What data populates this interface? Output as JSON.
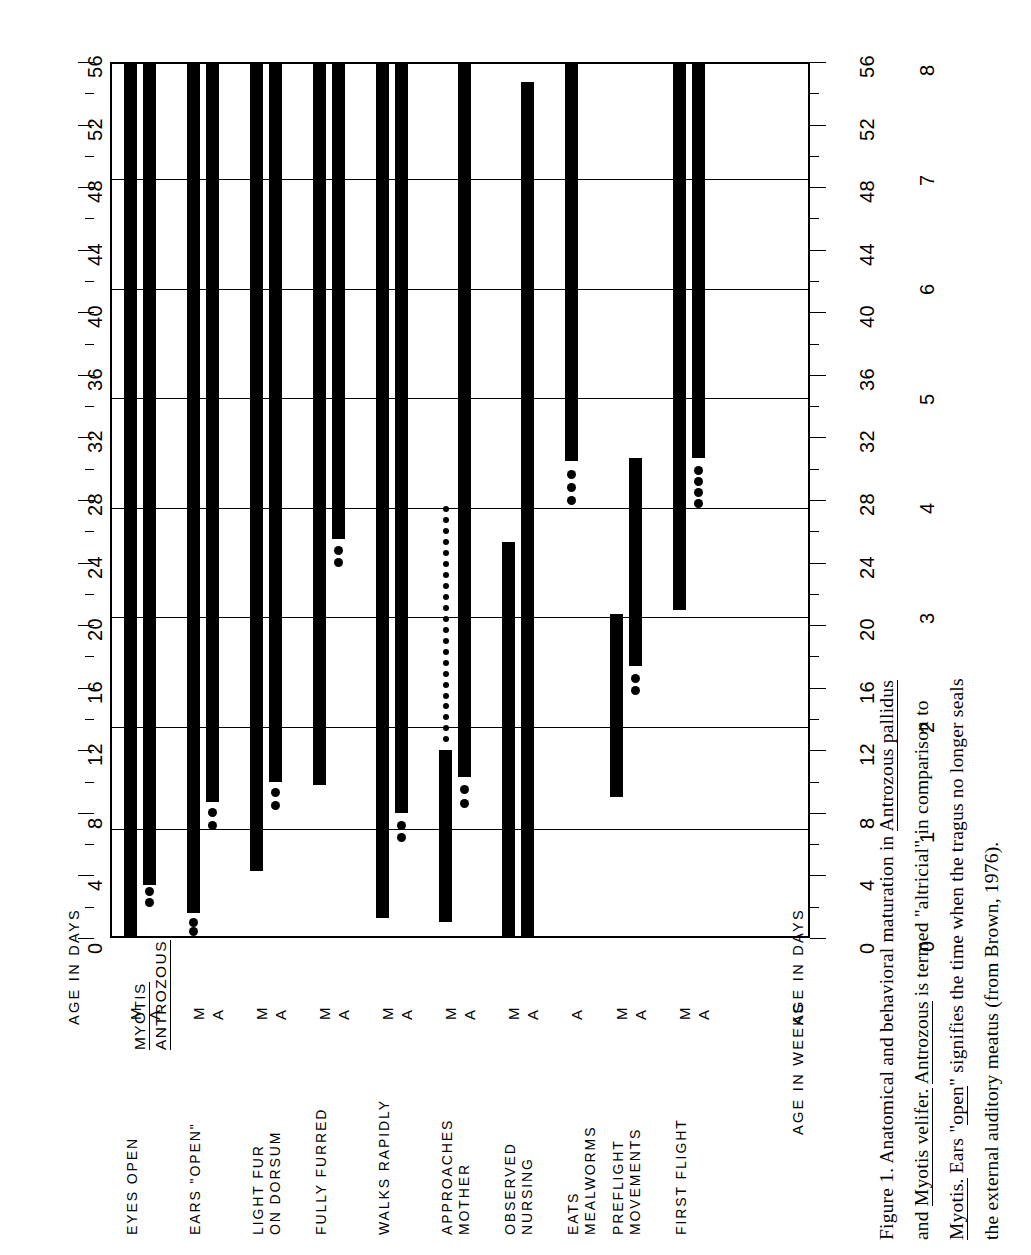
{
  "figure": {
    "caption_lines": [
      "Figure 1.  Anatomical and behavioral maturation in Antrozous pallidus",
      "and Myotis velifer.  Antrozous is termed \"altricial\" in comparison to",
      "Myotis.  Ears \"open\" signifies the time when the tragus no longer seals",
      "the external auditory meatus (from Brown, 1976)."
    ],
    "caption_underlined": [
      [
        "Antrozous pallidus"
      ],
      [
        "Myotis velifer.",
        "Antrozous"
      ],
      [
        "Myotis.",
        "open"
      ],
      []
    ]
  },
  "axes": {
    "days_label": "AGE IN DAYS",
    "weeks_label": "AGE IN WEEKS",
    "days_ticks": [
      0,
      4,
      8,
      12,
      16,
      20,
      24,
      28,
      32,
      36,
      40,
      44,
      48,
      52,
      56
    ],
    "weeks_ticks": [
      0,
      1,
      2,
      3,
      4,
      5,
      6,
      7,
      8
    ],
    "days_max": 56,
    "weeks_max": 8,
    "gridlines_days": [
      7,
      13.5,
      20.5,
      27.5,
      34.5,
      41.5,
      48.5
    ]
  },
  "legend": {
    "myotis": "MYOTIS",
    "antrozous": "ANTROZOUS",
    "species_m": "M",
    "species_a": "A"
  },
  "chart_data": {
    "type": "bar",
    "xlabel": "",
    "ylabel": "AGE IN DAYS",
    "ylabel_secondary": "AGE IN WEEKS",
    "ylim": [
      0,
      56
    ],
    "grid": true,
    "orientation": "vertical-ranges",
    "legend_position": "bottom-left",
    "note": "Each behavior has an M (Myotis velifer) and A (Antrozous pallidus) bar. Solid bar = observed range, dots = tapering/uncertain extension.",
    "categories": [
      "EYES OPEN",
      "EARS \"OPEN\"",
      "LIGHT FUR ON DORSUM",
      "FULLY FURRED",
      "WALKS RAPIDLY",
      "APPROACHES MOTHER",
      "OBSERVED NURSING",
      "EATS MEALWORMS",
      "PREFLIGHT MOVEMENTS",
      "FIRST FLIGHT"
    ],
    "bars": [
      {
        "category": "EYES OPEN",
        "species": "M",
        "start": 0.0,
        "end": 56.0,
        "dots": []
      },
      {
        "category": "EYES OPEN",
        "species": "A",
        "start": 3.4,
        "end": 56.0,
        "dots": [
          3.0,
          2.3
        ]
      },
      {
        "category": "EARS \"OPEN\"",
        "species": "M",
        "start": 1.6,
        "end": 56.0,
        "dots": [
          1.0,
          0.4
        ]
      },
      {
        "category": "EARS \"OPEN\"",
        "species": "A",
        "start": 8.7,
        "end": 56.0,
        "dots": [
          8.0,
          7.2
        ]
      },
      {
        "category": "LIGHT FUR ON DORSUM",
        "species": "M",
        "start": 4.3,
        "end": 56.0,
        "dots": []
      },
      {
        "category": "LIGHT FUR ON DORSUM",
        "species": "A",
        "start": 10.0,
        "end": 56.0,
        "dots": [
          9.3,
          8.5
        ]
      },
      {
        "category": "FULLY FURRED",
        "species": "M",
        "start": 9.8,
        "end": 56.0,
        "dots": []
      },
      {
        "category": "FULLY FURRED",
        "species": "A",
        "start": 25.5,
        "end": 56.0,
        "dots": [
          24.8,
          24.0
        ]
      },
      {
        "category": "WALKS RAPIDLY",
        "species": "M",
        "start": 1.3,
        "end": 56.0,
        "dots": []
      },
      {
        "category": "WALKS RAPIDLY",
        "species": "A",
        "start": 8.0,
        "end": 56.0,
        "dots": [
          7.2,
          6.4
        ]
      },
      {
        "category": "APPROACHES MOTHER",
        "species": "M",
        "start": 1.0,
        "end": 12.0,
        "dots": [
          12.7,
          13.4,
          14.1,
          14.8,
          15.5,
          16.2,
          16.9,
          17.6,
          18.3,
          19.0,
          19.7,
          20.4,
          21.1,
          21.8,
          22.5,
          23.2,
          23.9,
          24.6,
          25.3,
          26.0,
          26.7,
          27.4
        ]
      },
      {
        "category": "APPROACHES MOTHER",
        "species": "A",
        "start": 10.3,
        "end": 56.0,
        "dots": [
          9.5,
          8.6
        ]
      },
      {
        "category": "OBSERVED NURSING",
        "species": "M",
        "start": 0.0,
        "end": 25.3,
        "dots": []
      },
      {
        "category": "OBSERVED NURSING",
        "species": "A",
        "start": 0.0,
        "end": 54.7,
        "dots": []
      },
      {
        "category": "EATS MEALWORMS",
        "species": "A",
        "start": 30.5,
        "end": 56.0,
        "dots": [
          29.6,
          28.8,
          28.0
        ]
      },
      {
        "category": "PREFLIGHT MOVEMENTS",
        "species": "M",
        "start": 9.0,
        "end": 20.7,
        "dots": []
      },
      {
        "category": "PREFLIGHT MOVEMENTS",
        "species": "A",
        "start": 17.4,
        "end": 30.7,
        "dots": [
          16.6,
          15.8
        ]
      },
      {
        "category": "FIRST FLIGHT",
        "species": "M",
        "start": 21.0,
        "end": 56.0,
        "dots": []
      },
      {
        "category": "FIRST FLIGHT",
        "species": "A",
        "start": 30.7,
        "end": 56.0,
        "dots": [
          29.9,
          29.2,
          28.5,
          27.8
        ]
      }
    ]
  }
}
